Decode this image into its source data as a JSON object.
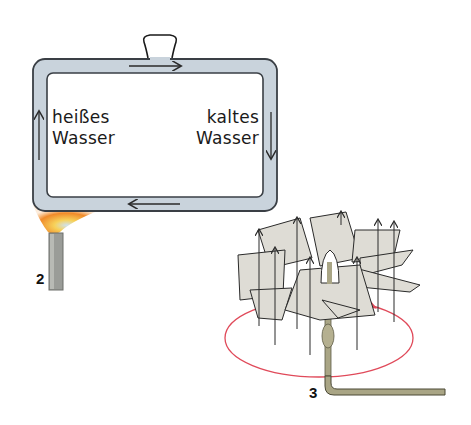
{
  "figure_2": {
    "number": "2",
    "hot_label_line1": "heißes",
    "hot_label_line2": "Wasser",
    "cold_label_line1": "kaltes",
    "cold_label_line2": "Wasser",
    "colors": {
      "pipe_fill": "#c9d3dc",
      "pipe_outline": "#3a3f45",
      "flame_outer": "#f08a2a",
      "flame_inner": "#f7d25a",
      "flame_core": "#b7d3e6",
      "burner": "#9a9c98"
    }
  },
  "figure_3": {
    "number": "3",
    "colors": {
      "paper_blades": "#dedcd5",
      "circle": "#e04a5a",
      "rod": "#a9a585",
      "arrows": "#2a2a2a"
    }
  }
}
